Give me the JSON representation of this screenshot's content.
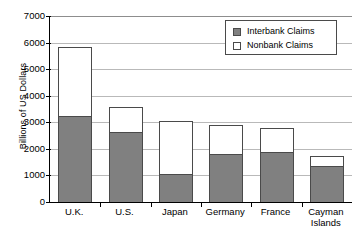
{
  "chart_data": {
    "type": "bar",
    "subtype": "stacked",
    "title": "",
    "xlabel": "",
    "ylabel": "Billions of US Dollars",
    "ylim": [
      0,
      7000
    ],
    "ytick_values": [
      0,
      1000,
      2000,
      3000,
      4000,
      5000,
      6000,
      7000
    ],
    "ytick_labels": [
      "0",
      "1000",
      "2000",
      "3000",
      "4000",
      "5000",
      "6000",
      "7000"
    ],
    "grid": true,
    "grid_axis": "y",
    "legend_position": "top-right",
    "categories": [
      "U.K.",
      "U.S.",
      "Japan",
      "Germany",
      "France",
      "Cayman Islands"
    ],
    "category_label_lines": [
      [
        "U.K."
      ],
      [
        "U.S."
      ],
      [
        "Japan"
      ],
      [
        "Germany"
      ],
      [
        "France"
      ],
      [
        "Cayman",
        "Islands"
      ]
    ],
    "series": [
      {
        "name": "Interbank Claims",
        "color": "#808080",
        "values": [
          3250,
          2630,
          1050,
          1800,
          1880,
          1340
        ]
      },
      {
        "name": "Nonbank Claims",
        "color": "#ffffff",
        "values": [
          2570,
          930,
          2000,
          1110,
          900,
          400
        ]
      }
    ],
    "totals": [
      5820,
      3560,
      3050,
      2910,
      2780,
      1740
    ]
  },
  "legend": {
    "items": [
      {
        "label": "Interbank Claims",
        "swatch": "filled"
      },
      {
        "label": "Nonbank Claims",
        "swatch": "hollow"
      }
    ]
  },
  "colors": {
    "interbank": "#808080",
    "nonbank": "#ffffff",
    "axis": "#000000",
    "grid": "#b9b9b9",
    "bar_border": "#4a4a4a"
  }
}
